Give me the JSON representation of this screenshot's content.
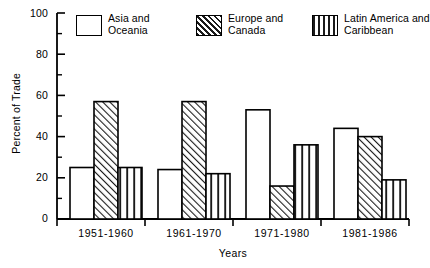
{
  "chart_data": {
    "type": "bar",
    "title": "",
    "xlabel": "Years",
    "ylabel": "Percent of Trade",
    "categories": [
      "1951-1960",
      "1961-1970",
      "1971-1980",
      "1981-1986"
    ],
    "series": [
      {
        "name": "Asia and Oceania",
        "pattern": "solid-white",
        "values": [
          25,
          24,
          53,
          44
        ]
      },
      {
        "name": "Europe and Canada",
        "pattern": "diagonal-hatch",
        "values": [
          57,
          57,
          16,
          40
        ]
      },
      {
        "name": "Latin America and Caribbean",
        "pattern": "vertical-stripes",
        "values": [
          25,
          22,
          36,
          19
        ]
      }
    ],
    "ylim": [
      0,
      100
    ],
    "yticks": [
      0,
      20,
      40,
      60,
      80,
      100
    ],
    "ytick_labels": [
      "0",
      "20",
      "40",
      "60",
      "80",
      "100"
    ],
    "minor_yticks": [
      10,
      30,
      50,
      70,
      90
    ],
    "grid": false,
    "legend_position": "top-inside",
    "colors": {
      "axis": "#000000",
      "bar_edge": "#000000",
      "bar_fill": "#ffffff",
      "background": "#ffffff"
    }
  },
  "legend": {
    "entries": [
      {
        "line1": "Asia and",
        "line2": "Oceania"
      },
      {
        "line1": "Europe and",
        "line2": "Canada"
      },
      {
        "line1": "Latin America and",
        "line2": "Caribbean"
      }
    ]
  }
}
